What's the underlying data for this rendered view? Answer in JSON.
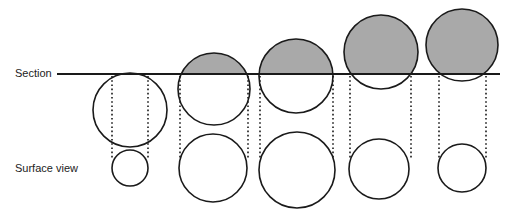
{
  "labels": {
    "section": "Section",
    "surface_view": "Surface view"
  },
  "colors": {
    "stroke": "#1a1a1a",
    "cap_fill": "#a9a9a9",
    "background": "#ffffff"
  },
  "section_line": {
    "x1": 57,
    "x2": 500,
    "y": 74
  },
  "particles": [
    {
      "id": 1,
      "section": {
        "cx": 130,
        "cy": 110,
        "r": 37
      },
      "surface": {
        "cx": 130,
        "cy": 168,
        "r": 18
      },
      "projection_x": [
        112,
        148
      ]
    },
    {
      "id": 2,
      "section": {
        "cx": 214,
        "cy": 89,
        "r": 36
      },
      "surface": {
        "cx": 213,
        "cy": 168,
        "r": 34
      },
      "projection_x": [
        180,
        248
      ]
    },
    {
      "id": 3,
      "section": {
        "cx": 296,
        "cy": 76,
        "r": 37
      },
      "surface": {
        "cx": 297,
        "cy": 170,
        "r": 38
      },
      "projection_x": [
        260,
        333
      ]
    },
    {
      "id": 4,
      "section": {
        "cx": 381,
        "cy": 52,
        "r": 37
      },
      "surface": {
        "cx": 379,
        "cy": 169,
        "r": 30
      },
      "projection_x": [
        350,
        411
      ]
    },
    {
      "id": 5,
      "section": {
        "cx": 462,
        "cy": 45,
        "r": 36
      },
      "surface": {
        "cx": 462,
        "cy": 168,
        "r": 24
      },
      "projection_x": [
        439,
        486
      ]
    }
  ]
}
